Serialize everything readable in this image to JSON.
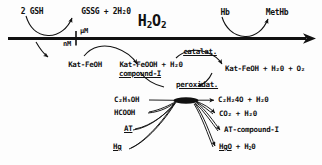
{
  "diagram": {
    "axis": {
      "name": "h2o2-concentration-axis",
      "tick_left_label": "nM",
      "tick_right_label": "µM",
      "main_label": "H₂O₂",
      "main_label_base": "H",
      "main_label_sub1": "2",
      "main_label_mid": "O",
      "main_label_sub2": "2"
    },
    "top_labels": [
      {
        "name": "gsh-substrate",
        "text": "2 GSH"
      },
      {
        "name": "gssg-product",
        "text": "GSSG + 2H₂0"
      },
      {
        "name": "hb-substrate",
        "text": "Hb"
      },
      {
        "name": "methb-product",
        "text": "MetHb"
      }
    ],
    "enzymes": [
      {
        "name": "catalase-enzyme",
        "text": "catalat."
      },
      {
        "name": "peroxidase-enzyme",
        "text": "peroxidat."
      }
    ],
    "catalase_branch": {
      "reactant": "Kat-FeOH",
      "intermediate_line1": "Kat-FeOOH + H₂0",
      "intermediate_line2": "compound-I",
      "product": "Kat-FeOH + H₂0 + O₂"
    },
    "peroxidase_substrates": [
      {
        "name": "substrate-ethanol",
        "text": "C₂H₅OH",
        "underlined": false
      },
      {
        "name": "substrate-formic-acid",
        "text": "HCOOH",
        "underlined": false
      },
      {
        "name": "substrate-at",
        "text": "AT",
        "underlined": true
      },
      {
        "name": "substrate-mercury",
        "text": "Hg",
        "underlined": true
      }
    ],
    "peroxidase_products": [
      {
        "name": "product-acetaldehyde",
        "text": "C₂H₂4O + H₂0",
        "underlined": false
      },
      {
        "name": "product-carbon-dioxide",
        "text": "CO₂  + H₂0",
        "underlined": false
      },
      {
        "name": "product-at-compound-i",
        "text": "AT-compound-I",
        "underlined": false
      },
      {
        "name": "product-mercuric-oxide",
        "text": "HgO + H₂0",
        "underlined": true
      }
    ],
    "colors": {
      "ink": "#111111",
      "background": "#fdfdfd"
    }
  }
}
